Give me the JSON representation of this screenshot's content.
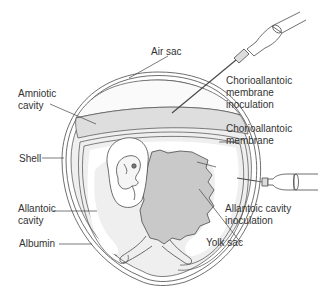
{
  "diagram": {
    "colors": {
      "outline": "#4a4a4a",
      "shell_fill": "#ffffff",
      "membrane_fill": "#e4e4e4",
      "yolk_fill": "#c9c9c9",
      "albumin_fill": "#ececec",
      "text": "#333333"
    },
    "labels": {
      "air_sac": "Air sac",
      "amniotic_cavity": "Amniotic\ncavity",
      "shell": "Shell",
      "allantoic_cavity": "Allantoic\ncavity",
      "albumin": "Albumin",
      "cam_inoculation": "Chorioallantoic\nmembrane\ninoculation",
      "cam": "Chorioallantoic\nmembrane",
      "allantoic_inoculation": "Allantoic cavity\ninoculation",
      "yolk_sac": "Yolk sac"
    },
    "icons": [
      "syringe-icon",
      "syringe-icon"
    ]
  }
}
